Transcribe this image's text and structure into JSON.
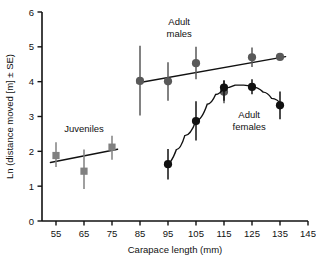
{
  "chart_data": {
    "type": "scatter",
    "title": "",
    "xlabel": "Carapace length (mm)",
    "ylabel": "Ln (distance moved [m] ± SE)",
    "xlim": [
      50,
      145
    ],
    "ylim": [
      0,
      6
    ],
    "xticks": [
      55,
      65,
      75,
      85,
      95,
      105,
      115,
      125,
      135,
      145
    ],
    "yticks": [
      0,
      1,
      2,
      3,
      4,
      5,
      6
    ],
    "grid": false,
    "legend_position": "inline-annotations",
    "series": [
      {
        "name": "Juveniles",
        "marker": "square",
        "color": "#808080",
        "x": [
          55,
          65,
          75
        ],
        "values": [
          1.88,
          1.43,
          2.12
        ],
        "err_low": [
          1.55,
          0.92,
          1.76
        ],
        "err_high": [
          2.26,
          2.05,
          2.45
        ],
        "fit": {
          "type": "linear",
          "x": [
            53,
            77
          ],
          "y": [
            1.68,
            2.06
          ]
        }
      },
      {
        "name": "Adult males",
        "marker": "circle",
        "color": "#595959",
        "x": [
          85,
          95,
          105,
          115,
          125,
          135
        ],
        "values": [
          4.02,
          4.01,
          4.53,
          3.71,
          4.7,
          4.71
        ],
        "err_low": [
          3.03,
          3.45,
          4.07,
          3.38,
          4.42,
          4.71
        ],
        "err_high": [
          5.03,
          4.56,
          5.0,
          4.04,
          4.98,
          4.71
        ],
        "fit": {
          "type": "linear",
          "x": [
            84,
            137
          ],
          "y": [
            3.96,
            4.72
          ]
        }
      },
      {
        "name": "Adult females",
        "marker": "circle",
        "color": "#111111",
        "x": [
          95,
          105,
          115,
          125,
          135
        ],
        "values": [
          1.63,
          2.87,
          3.83,
          3.85,
          3.32
        ],
        "err_low": [
          1.19,
          2.31,
          3.45,
          3.64,
          2.92
        ],
        "err_high": [
          2.07,
          3.44,
          4.03,
          4.07,
          3.72
        ],
        "fit": {
          "type": "curve",
          "points": [
            [
              94,
              1.6
            ],
            [
              98,
              2.05
            ],
            [
              101,
              2.45
            ],
            [
              105,
              2.88
            ],
            [
              109,
              3.35
            ],
            [
              112,
              3.63
            ],
            [
              115,
              3.82
            ],
            [
              119,
              3.9
            ],
            [
              122,
              3.9
            ],
            [
              125,
              3.85
            ],
            [
              129,
              3.7
            ],
            [
              132,
              3.52
            ],
            [
              136,
              3.3
            ]
          ]
        }
      }
    ],
    "annotations": [
      {
        "name": "juveniles",
        "text_lines": [
          "Juveniles"
        ],
        "x": 65,
        "y": 2.55
      },
      {
        "name": "adult-males",
        "text_lines": [
          "Adult",
          "males"
        ],
        "x": 99,
        "y": 5.62
      },
      {
        "name": "adult-females",
        "text_lines": [
          "Adult",
          "females"
        ],
        "x": 124,
        "y": 2.95
      }
    ]
  }
}
